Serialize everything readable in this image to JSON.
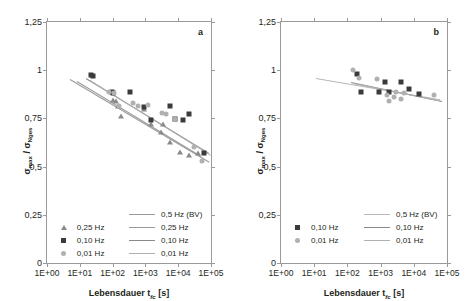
{
  "figure": {
    "panels": [
      {
        "letter": "a",
        "xlabel": "Lebensdauer t",
        "xlabel_sub": "fc",
        "xlabel_unit": " [s]",
        "ylabel_num": "σ",
        "ylabel_num_sub": "max",
        "ylabel_den": "σ",
        "ylabel_den_sub": "Nges",
        "ylabel": "σmax / σNges",
        "yticks": [
          "0",
          "0,25",
          "0,5",
          "0,75",
          "1",
          "1,25"
        ],
        "xticks": [
          "1E+00",
          "1E+01",
          "1E+02",
          "1E+03",
          "1E+04",
          "1E+05"
        ],
        "legend_markers": [
          {
            "symbol": "triangle",
            "label": "0,25 Hz",
            "color": "#8a8a8a"
          },
          {
            "symbol": "square",
            "label": "0,10 Hz",
            "color": "#3b3b3b"
          },
          {
            "symbol": "circle",
            "label": "0,01 Hz",
            "color": "#b0b0b0"
          }
        ],
        "legend_lines": [
          {
            "label": "0,5 Hz (BV)",
            "color": "#9a9a9a"
          },
          {
            "label": "0,25 Hz",
            "color": "#9a9a9a"
          },
          {
            "label": "0,10 Hz",
            "color": "#8a8a8a"
          },
          {
            "label": "0,01 Hz",
            "color": "#b0b0b0"
          }
        ]
      },
      {
        "letter": "b",
        "xlabel": "Lebensdauer t",
        "xlabel_sub": "fc",
        "xlabel_unit": " [s]",
        "ylabel": "σmax / σNges",
        "yticks": [
          "0",
          "0,25",
          "0,5",
          "0,75",
          "1",
          "1,25"
        ],
        "xticks": [
          "1E+00",
          "1E+01",
          "1E+02",
          "1E+03",
          "1E+04",
          "1E+05"
        ],
        "legend_markers": [
          {
            "symbol": "square",
            "label": "0,10 Hz",
            "color": "#3b3b3b"
          },
          {
            "symbol": "circle",
            "label": "0,01 Hz",
            "color": "#b0b0b0"
          }
        ],
        "legend_lines": [
          {
            "label": "0,5 Hz (BV)",
            "color": "#b8b8b8"
          },
          {
            "label": "0,10 Hz",
            "color": "#8a8a8a"
          },
          {
            "label": "0,01 Hz",
            "color": "#b0b0b0"
          }
        ]
      }
    ]
  },
  "chart_data": [
    {
      "type": "scatter",
      "panel": "a",
      "title": "",
      "xlabel": "Lebensdauer t_fc [s]",
      "ylabel": "σmax / σNges",
      "xscale": "log",
      "xlim": [
        1,
        100000
      ],
      "ylim": [
        0,
        1.25
      ],
      "xticks": [
        1,
        10,
        100,
        1000,
        10000,
        100000
      ],
      "yticks": [
        0,
        0.25,
        0.5,
        0.75,
        1,
        1.25
      ],
      "grid": false,
      "series": [
        {
          "name": "0,25 Hz",
          "marker": "triangle",
          "color": "#8a8a8a",
          "points": [
            [
              105,
              0.845
            ],
            [
              130,
              0.84
            ],
            [
              150,
              0.815
            ],
            [
              175,
              0.76
            ],
            [
              900,
              0.8
            ],
            [
              1500,
              0.72
            ],
            [
              3000,
              0.68
            ],
            [
              3500,
              0.72
            ],
            [
              5500,
              0.63
            ],
            [
              11000,
              0.575
            ],
            [
              22000,
              0.56
            ],
            [
              40000,
              0.57
            ]
          ]
        },
        {
          "name": "0,10 Hz",
          "marker": "square",
          "color": "#3b3b3b",
          "points": [
            [
              22,
              0.975
            ],
            [
              26,
              0.972
            ],
            [
              95,
              0.885
            ],
            [
              105,
              0.88
            ],
            [
              330,
              0.888
            ],
            [
              900,
              0.808
            ],
            [
              1500,
              0.74
            ],
            [
              5500,
              0.812
            ],
            [
              8000,
              0.745
            ],
            [
              14000,
              0.74
            ],
            [
              22000,
              0.775
            ],
            [
              60000,
              0.57
            ]
          ]
        },
        {
          "name": "0,01 Hz",
          "marker": "circle",
          "color": "#b0b0b0",
          "points": [
            [
              80,
              0.885
            ],
            [
              110,
              0.884
            ],
            [
              160,
              0.812
            ],
            [
              420,
              0.83
            ],
            [
              600,
              0.815
            ],
            [
              1200,
              0.82
            ],
            [
              3300,
              0.78
            ],
            [
              4200,
              0.775
            ],
            [
              8000,
              0.745
            ],
            [
              30000,
              0.6
            ],
            [
              52000,
              0.53
            ]
          ]
        }
      ],
      "trendlines": [
        {
          "name": "0,5 Hz (BV)",
          "color": "#9a9a9a",
          "x0": 5,
          "y0": 0.955,
          "x1": 90000,
          "y1": 0.525
        },
        {
          "name": "0,25 Hz",
          "color": "#9a9a9a",
          "x0": 8,
          "y0": 0.945,
          "x1": 50000,
          "y1": 0.555
        },
        {
          "name": "0,10 Hz",
          "color": "#8a8a8a",
          "x0": 16,
          "y0": 0.96,
          "x1": 90000,
          "y1": 0.572
        },
        {
          "name": "0,01 Hz",
          "color": "#b0b0b0",
          "x0": 20,
          "y0": 0.948,
          "x1": 95000,
          "y1": 0.56
        }
      ]
    },
    {
      "type": "scatter",
      "panel": "b",
      "title": "",
      "xlabel": "Lebensdauer t_fc [s]",
      "ylabel": "σmax / σNges",
      "xscale": "log",
      "xlim": [
        1,
        100000
      ],
      "ylim": [
        0,
        1.25
      ],
      "xticks": [
        1,
        10,
        100,
        1000,
        10000,
        100000
      ],
      "yticks": [
        0,
        0.25,
        0.5,
        0.75,
        1,
        1.25
      ],
      "grid": false,
      "series": [
        {
          "name": "0,10 Hz",
          "marker": "square",
          "color": "#3b3b3b",
          "points": [
            [
              200,
              0.978
            ],
            [
              260,
              0.885
            ],
            [
              900,
              0.888
            ],
            [
              1400,
              0.94
            ],
            [
              1800,
              0.885
            ],
            [
              4200,
              0.94
            ],
            [
              7000,
              0.9
            ],
            [
              14000,
              0.878
            ]
          ]
        },
        {
          "name": "0,01 Hz",
          "marker": "circle",
          "color": "#b0b0b0",
          "points": [
            [
              150,
              1.0
            ],
            [
              230,
              0.958
            ],
            [
              800,
              0.955
            ],
            [
              1600,
              0.872
            ],
            [
              1800,
              0.838
            ],
            [
              2600,
              0.862
            ],
            [
              3000,
              0.886
            ],
            [
              4200,
              0.852
            ],
            [
              5200,
              0.88
            ],
            [
              40000,
              0.872
            ]
          ]
        }
      ],
      "trendlines": [
        {
          "name": "0,5 Hz (BV)",
          "color": "#b8b8b8",
          "x0": 11,
          "y0": 0.962,
          "x1": 60000,
          "y1": 0.852
        },
        {
          "name": "0,10 Hz",
          "color": "#8a8a8a",
          "x0": 130,
          "y0": 0.938,
          "x1": 70000,
          "y1": 0.84
        },
        {
          "name": "0,01 Hz",
          "color": "#b0b0b0",
          "x0": 150,
          "y0": 0.935,
          "x1": 62000,
          "y1": 0.845
        }
      ]
    }
  ]
}
